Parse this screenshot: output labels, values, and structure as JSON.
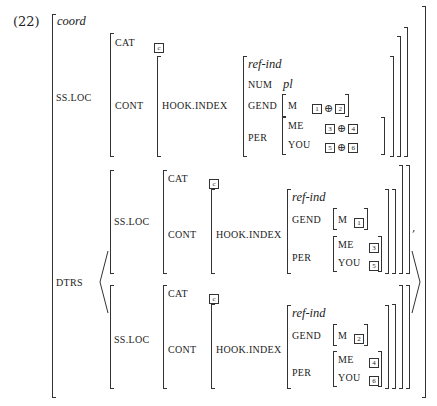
{
  "example_number": "(22)",
  "avm": {
    "type": "coord",
    "ss_loc_label": "SS.LOC",
    "dtrs_label": "DTRS",
    "mother": {
      "cat_label": "CAT",
      "cat_tag": "c",
      "cont_label": "CONT",
      "hook_label": "HOOK.INDEX",
      "index": {
        "type": "ref-ind",
        "num_label": "NUM",
        "num_value": "pl",
        "gend_label": "GEND",
        "m_label": "M",
        "m_tags": [
          "1",
          "2"
        ],
        "per_label": "PER",
        "me_label": "ME",
        "me_tags": [
          "3",
          "4"
        ],
        "you_label": "YOU",
        "you_tags": [
          "5",
          "6"
        ],
        "operator": "⊕"
      }
    },
    "daughters": [
      {
        "ss_loc_label": "SS.LOC",
        "cat_label": "CAT",
        "cat_tag": "c",
        "cont_label": "CONT",
        "hook_label": "HOOK.INDEX",
        "index": {
          "type": "ref-ind",
          "gend_label": "GEND",
          "m_label": "M",
          "m_tag": "1",
          "per_label": "PER",
          "me_label": "ME",
          "me_tag": "3",
          "you_label": "YOU",
          "you_tag": "5"
        }
      },
      {
        "ss_loc_label": "SS.LOC",
        "cat_label": "CAT",
        "cat_tag": "c",
        "cont_label": "CONT",
        "hook_label": "HOOK.INDEX",
        "index": {
          "type": "ref-ind",
          "gend_label": "GEND",
          "m_label": "M",
          "m_tag": "2",
          "per_label": "PER",
          "me_label": "ME",
          "me_tag": "4",
          "you_label": "YOU",
          "you_tag": "6"
        }
      }
    ],
    "list_separator": ","
  }
}
